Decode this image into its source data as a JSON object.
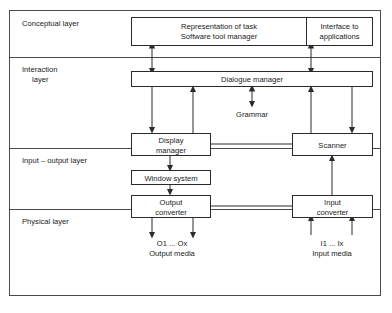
{
  "diagram": {
    "colors": {
      "frame": "#4a4a4a",
      "box_stroke": "#2b2b2b",
      "background": "#ffffff",
      "text": "#1a1a1a"
    },
    "layers": [
      {
        "id": "conceptual",
        "label": "Conceptual layer"
      },
      {
        "id": "interaction",
        "label_line1": "Interaction",
        "label_line2": "layer"
      },
      {
        "id": "input-output",
        "label": "Input – output layer"
      },
      {
        "id": "physical",
        "label": "Physical layer"
      }
    ],
    "nodes": [
      {
        "id": "representation-of-task",
        "line1": "Representation of task",
        "line2": "Software tool manager"
      },
      {
        "id": "interface-to-applications",
        "line1": "Interface to",
        "line2": "applications"
      },
      {
        "id": "dialogue-manager",
        "line1": "Dialogue manager",
        "line2": ""
      },
      {
        "id": "display-manager",
        "line1": "Display",
        "line2": "manager"
      },
      {
        "id": "scanner",
        "line1": "Scanner",
        "line2": ""
      },
      {
        "id": "window-system",
        "line1": "Window system",
        "line2": ""
      },
      {
        "id": "output-converter",
        "line1": "Output",
        "line2": "converter"
      },
      {
        "id": "input-converter",
        "line1": "Input",
        "line2": "converter"
      }
    ],
    "annotations": [
      {
        "id": "grammar",
        "label": "Grammar"
      },
      {
        "id": "output-media-items",
        "label": "O1     ...     Ox"
      },
      {
        "id": "output-media-caption",
        "label": "Output media"
      },
      {
        "id": "input-media-items",
        "label": "I1     ...     Ix"
      },
      {
        "id": "input-media-caption",
        "label": "Input media"
      }
    ]
  }
}
